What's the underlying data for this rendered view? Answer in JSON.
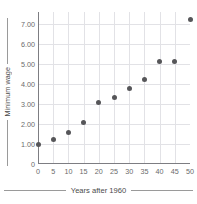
{
  "chart_data": {
    "type": "scatter",
    "title": "",
    "xlabel": "Years after 1960",
    "ylabel": "Minimum wage",
    "x": [
      0,
      5,
      10,
      15,
      20,
      25,
      30,
      35,
      40,
      45,
      50
    ],
    "values": [
      1.0,
      1.25,
      1.6,
      2.1,
      3.1,
      3.35,
      3.8,
      4.25,
      5.15,
      5.15,
      7.25
    ],
    "points": [
      {
        "x": 0,
        "y": 1.0
      },
      {
        "x": 5,
        "y": 1.25
      },
      {
        "x": 10,
        "y": 1.6
      },
      {
        "x": 15,
        "y": 2.1
      },
      {
        "x": 20,
        "y": 3.1
      },
      {
        "x": 25,
        "y": 3.35
      },
      {
        "x": 30,
        "y": 3.8
      },
      {
        "x": 35,
        "y": 4.25
      },
      {
        "x": 40,
        "y": 5.15
      },
      {
        "x": 45,
        "y": 5.15
      },
      {
        "x": 50,
        "y": 7.25
      }
    ],
    "xlim": [
      0,
      50
    ],
    "ylim": [
      0,
      7.6
    ],
    "xticks": [
      0,
      5,
      10,
      15,
      20,
      25,
      30,
      35,
      40,
      45,
      50
    ],
    "xtick_labels": [
      "0",
      "5",
      "10",
      "15",
      "20",
      "25",
      "30",
      "35",
      "40",
      "45",
      "50"
    ],
    "yticks": [
      0,
      1,
      2,
      3,
      4,
      5,
      6,
      7
    ],
    "ytick_labels": [
      "0",
      "1.00",
      "2.00",
      "3.00",
      "4.00",
      "5.00",
      "6.00",
      "7.00"
    ],
    "grid": true,
    "legend": null,
    "marker_color": "#565659",
    "grid_color": "#e2e2e6",
    "axis_color": "#7d7d82",
    "tick_label_color": "#6a6a6a",
    "axis_title_color": "#4a4a4a",
    "background_color": "#ffffff"
  }
}
